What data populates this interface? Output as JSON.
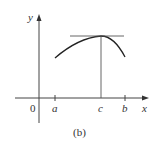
{
  "figure": {
    "caption": "(b)",
    "colors": {
      "axis": "#444444",
      "curve": "#222222",
      "guide": "#555555",
      "text": "#333333"
    }
  },
  "axes": {
    "x_label": "x",
    "y_label": "y",
    "origin_label": "0"
  },
  "points": {
    "a_label": "a",
    "b_label": "b",
    "c_label": "c"
  },
  "description": {
    "curve": "concave-down arc from x=a rising to a maximum at x=c and falling toward x=b",
    "tangent": "horizontal tangent line at the maximum point (c, f(c))",
    "vertical": "vertical line from the maximum down to x=c on the x-axis"
  }
}
